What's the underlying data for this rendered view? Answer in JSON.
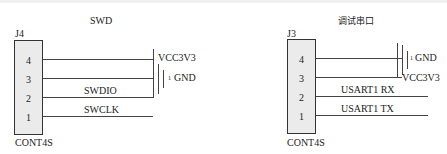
{
  "left": {
    "title": "SWD",
    "ref": "J4",
    "part": "CONT4S",
    "pins": [
      "4",
      "3",
      "2",
      "1"
    ],
    "net_labels": {
      "vcc": "VCC3V3",
      "gnd": "GND",
      "gnd_marker": "1",
      "pin2": "SWDIO",
      "pin1": "SWCLK"
    }
  },
  "right": {
    "title": "调试串口",
    "ref": "J3",
    "part": "CONT4S",
    "pins": [
      "4",
      "3",
      "2",
      "1"
    ],
    "net_labels": {
      "gnd": "GND",
      "gnd_marker": "1",
      "vcc": "VCC3V3",
      "pin2": "USART1 RX",
      "pin1": "USART1 TX"
    }
  }
}
